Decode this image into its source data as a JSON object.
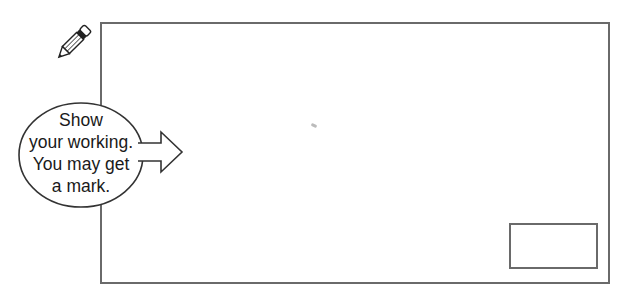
{
  "pencil": {
    "icon": "pencil-icon"
  },
  "callout": {
    "lines": [
      "Show",
      "your working.",
      "You may get",
      "a mark."
    ]
  },
  "working_area": {
    "label": ""
  },
  "answer_box": {
    "value": ""
  },
  "colors": {
    "stroke": "#6a6a6a",
    "text": "#1a1a1a"
  }
}
